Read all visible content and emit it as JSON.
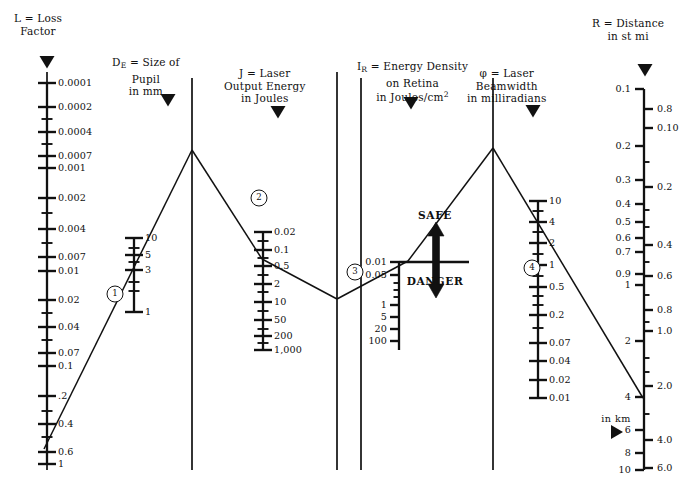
{
  "figure": {
    "kind": "laser-safety-nomogram",
    "width": 698,
    "height": 498,
    "ink": "#111111",
    "bg": "#ffffff"
  },
  "chart_data": {
    "type": "line",
    "xlabel": "",
    "ylabel": "",
    "grid": false,
    "legend": "none",
    "axes": [
      {
        "id": "L",
        "symbol": "L",
        "name": "Loss Factor",
        "header_lines": [
          "L = Loss",
          "Factor"
        ],
        "units": "",
        "label_side": "right",
        "x": 47,
        "y_top": 83,
        "y_bottom": 464,
        "ticks": [
          {
            "label": "0.0001",
            "y": 83,
            "major": true
          },
          {
            "label": "0.0002",
            "y": 107,
            "major": true
          },
          {
            "label": "",
            "y": 119,
            "major": false
          },
          {
            "label": "0.0004",
            "y": 132,
            "major": true
          },
          {
            "label": "",
            "y": 144,
            "major": false
          },
          {
            "label": "0.0007",
            "y": 156,
            "major": true
          },
          {
            "label": "0.001",
            "y": 168,
            "major": true
          },
          {
            "label": "0.002",
            "y": 198,
            "major": true
          },
          {
            "label": "",
            "y": 213,
            "major": false
          },
          {
            "label": "0.004",
            "y": 229,
            "major": true
          },
          {
            "label": "",
            "y": 243,
            "major": false
          },
          {
            "label": "0.007",
            "y": 257,
            "major": true
          },
          {
            "label": "0.01",
            "y": 271,
            "major": true
          },
          {
            "label": "0.02",
            "y": 300,
            "major": true
          },
          {
            "label": "",
            "y": 313,
            "major": false
          },
          {
            "label": "0.04",
            "y": 327,
            "major": true
          },
          {
            "label": "",
            "y": 340,
            "major": false
          },
          {
            "label": "0.07",
            "y": 353,
            "major": true
          },
          {
            "label": "0.1",
            "y": 366,
            "major": true
          },
          {
            "label": ".2",
            "y": 396,
            "major": true
          },
          {
            "label": "",
            "y": 411,
            "major": false
          },
          {
            "label": "0.4",
            "y": 424,
            "major": true
          },
          {
            "label": "",
            "y": 437,
            "major": false
          },
          {
            "label": "0.6",
            "y": 452,
            "major": true
          },
          {
            "label": "1",
            "y": 464,
            "major": true
          }
        ]
      },
      {
        "id": "DE",
        "symbol": "D_E",
        "name": "Size of Pupil",
        "header_lines": [
          "D",
          "E",
          " =  Size of",
          "Pupil",
          "in mm"
        ],
        "units": "mm",
        "label_side": "right",
        "x": 134,
        "y_top": 238,
        "y_bottom": 312,
        "ticks": [
          {
            "label": "10",
            "y": 238,
            "major": true
          },
          {
            "label": "",
            "y": 248,
            "major": false
          },
          {
            "label": "5",
            "y": 255,
            "major": true
          },
          {
            "label": "",
            "y": 262,
            "major": false
          },
          {
            "label": "3",
            "y": 270,
            "major": true
          },
          {
            "label": "",
            "y": 282,
            "major": false
          },
          {
            "label": "",
            "y": 291,
            "major": false
          },
          {
            "label": "1",
            "y": 312,
            "major": true
          }
        ]
      },
      {
        "id": "J",
        "symbol": "J",
        "name": "Laser Output Energy",
        "header_lines": [
          "J = Laser",
          "Output Energy",
          "in Joules"
        ],
        "units": "Joules",
        "label_side": "right",
        "x": 263,
        "y_top": 232,
        "y_bottom": 350,
        "ticks": [
          {
            "label": "0.02",
            "y": 232,
            "major": true
          },
          {
            "label": "",
            "y": 241,
            "major": false
          },
          {
            "label": "0.1",
            "y": 250,
            "major": true
          },
          {
            "label": "",
            "y": 258,
            "major": false
          },
          {
            "label": "0.5",
            "y": 266,
            "major": true
          },
          {
            "label": "",
            "y": 275,
            "major": false
          },
          {
            "label": "2",
            "y": 284,
            "major": true
          },
          {
            "label": "",
            "y": 292,
            "major": false
          },
          {
            "label": "10",
            "y": 302,
            "major": true
          },
          {
            "label": "",
            "y": 311,
            "major": false
          },
          {
            "label": "50",
            "y": 320,
            "major": true
          },
          {
            "label": "",
            "y": 329,
            "major": false
          },
          {
            "label": "200",
            "y": 336,
            "major": true
          },
          {
            "label": "",
            "y": 343,
            "major": false
          },
          {
            "label": "1,000",
            "y": 350,
            "major": true
          }
        ]
      },
      {
        "id": "IR",
        "symbol": "I_R",
        "name": "Energy Density on Retina",
        "header_lines": [
          "I",
          "R",
          " = Energy Density",
          "on Retina",
          "in Joules/cm",
          "2"
        ],
        "units": "Joules/cm2",
        "label_side": "left",
        "x": 399,
        "y_top": 262,
        "y_bottom": 350,
        "ticks": [
          {
            "label": "0.01",
            "y": 262,
            "major": true
          },
          {
            "label": "0.05",
            "y": 275,
            "major": true
          },
          {
            "label": "",
            "y": 283,
            "major": false
          },
          {
            "label": "",
            "y": 290,
            "major": false
          },
          {
            "label": "",
            "y": 297,
            "major": false
          },
          {
            "label": "1",
            "y": 305,
            "major": true
          },
          {
            "label": "5",
            "y": 317,
            "major": true
          },
          {
            "label": "20",
            "y": 329,
            "major": true
          },
          {
            "label": "100",
            "y": 341,
            "major": true
          }
        ]
      },
      {
        "id": "PHI",
        "symbol": "φ",
        "name": "Laser Beamwidth",
        "header_lines": [
          "φ = Laser",
          "Beamwidth",
          "in milliradians"
        ],
        "units": "milliradians",
        "label_side": "right",
        "x": 538,
        "y_top": 201,
        "y_bottom": 398,
        "ticks": [
          {
            "label": "10",
            "y": 201,
            "major": true
          },
          {
            "label": "",
            "y": 211,
            "major": false
          },
          {
            "label": "4",
            "y": 222,
            "major": true
          },
          {
            "label": "",
            "y": 232,
            "major": false
          },
          {
            "label": "2",
            "y": 243,
            "major": true
          },
          {
            "label": "",
            "y": 254,
            "major": false
          },
          {
            "label": "1",
            "y": 265,
            "major": true
          },
          {
            "label": "",
            "y": 276,
            "major": false
          },
          {
            "label": "0.5",
            "y": 287,
            "major": true
          },
          {
            "label": "",
            "y": 296,
            "major": false
          },
          {
            "label": "",
            "y": 305,
            "major": false
          },
          {
            "label": "0.2",
            "y": 315,
            "major": true
          },
          {
            "label": "",
            "y": 328,
            "major": false
          },
          {
            "label": "0.07",
            "y": 343,
            "major": true
          },
          {
            "label": "0.04",
            "y": 361,
            "major": true
          },
          {
            "label": "0.02",
            "y": 380,
            "major": true
          },
          {
            "label": "0.01",
            "y": 398,
            "major": true
          }
        ]
      },
      {
        "id": "R",
        "symbol": "R",
        "name": "Distance",
        "header_lines": [
          "R = Distance",
          "in st mi"
        ],
        "units_left": "st mi",
        "units_right": "km",
        "label_side": "both",
        "x": 644,
        "y_top": 89,
        "y_bottom": 470,
        "ticks_left": [
          {
            "label": "0.1",
            "y": 89,
            "major": true
          },
          {
            "label": "0.2",
            "y": 146,
            "major": true
          },
          {
            "label": "0.3",
            "y": 180,
            "major": true
          },
          {
            "label": "0.4",
            "y": 204,
            "major": true
          },
          {
            "label": "0.5",
            "y": 222,
            "major": true
          },
          {
            "label": "0.6",
            "y": 238,
            "major": true
          },
          {
            "label": "0.7",
            "y": 252,
            "major": true
          },
          {
            "label": "0.9",
            "y": 274,
            "major": true
          },
          {
            "label": "1",
            "y": 285,
            "major": true
          },
          {
            "label": "2",
            "y": 341,
            "major": true
          },
          {
            "label": "4",
            "y": 397,
            "major": true
          },
          {
            "label": "6",
            "y": 430,
            "major": true
          },
          {
            "label": "8",
            "y": 453,
            "major": true
          },
          {
            "label": "10",
            "y": 470,
            "major": true
          }
        ],
        "ticks_right": [
          {
            "label": "0.8",
            "y": 109,
            "major": true
          },
          {
            "label": "0.10",
            "y": 128,
            "major": true
          },
          {
            "label": "",
            "y": 162,
            "major": false
          },
          {
            "label": "0.2",
            "y": 187,
            "major": true
          },
          {
            "label": "",
            "y": 210,
            "major": false
          },
          {
            "label": "",
            "y": 227,
            "major": false
          },
          {
            "label": "0.4",
            "y": 245,
            "major": true
          },
          {
            "label": "",
            "y": 262,
            "major": false
          },
          {
            "label": "0.6",
            "y": 276,
            "major": true
          },
          {
            "label": "",
            "y": 295,
            "major": false
          },
          {
            "label": "0.8",
            "y": 310,
            "major": true
          },
          {
            "label": "",
            "y": 322,
            "major": false
          },
          {
            "label": "1.0",
            "y": 331,
            "major": true
          },
          {
            "label": "",
            "y": 358,
            "major": false
          },
          {
            "label": "",
            "y": 372,
            "major": false
          },
          {
            "label": "2.0",
            "y": 386,
            "major": true
          },
          {
            "label": "",
            "y": 414,
            "major": false
          },
          {
            "label": "4.0",
            "y": 440,
            "major": true
          },
          {
            "label": "6.0",
            "y": 468,
            "major": true
          }
        ]
      }
    ],
    "rails": [
      {
        "name": "rail-L",
        "x": 47,
        "y1": 72,
        "y2": 470
      },
      {
        "name": "rail-DE",
        "x": 192,
        "y1": 78,
        "y2": 470
      },
      {
        "name": "rail-J",
        "x": 337,
        "y1": 72,
        "y2": 470
      },
      {
        "name": "rail-IR",
        "x": 361,
        "y1": 78,
        "y2": 470
      },
      {
        "name": "rail-PHI",
        "x": 493,
        "y1": 78,
        "y2": 470
      }
    ],
    "construction_lines": [
      {
        "name": "line-1",
        "x1": 44,
        "y1": 449,
        "x2": 192,
        "y2": 150
      },
      {
        "name": "line-2",
        "x1": 192,
        "y1": 150,
        "x2": 262,
        "y2": 259
      },
      {
        "name": "line-3",
        "x1": 262,
        "y1": 259,
        "x2": 337,
        "y2": 299
      },
      {
        "name": "line-4",
        "x1": 337,
        "y1": 299,
        "x2": 408,
        "y2": 261
      },
      {
        "name": "line-5",
        "x1": 408,
        "y1": 261,
        "x2": 493,
        "y2": 148
      },
      {
        "name": "line-6",
        "x1": 493,
        "y1": 148,
        "x2": 643,
        "y2": 398
      }
    ],
    "markers": [
      {
        "label": "1",
        "x": 115,
        "y": 294
      },
      {
        "label": "2",
        "x": 259,
        "y": 198
      },
      {
        "label": "3",
        "x": 355,
        "y": 272
      },
      {
        "label": "4",
        "x": 532,
        "y": 268
      }
    ],
    "callouts": {
      "safe": "SAFE",
      "danger": "DANGER",
      "km_note": "in km",
      "threshold_y": 262
    },
    "pointers": [
      {
        "name": "pointer-L",
        "x": 47,
        "y": 62,
        "dir": "down"
      },
      {
        "name": "pointer-DE",
        "x": 168,
        "y": 100,
        "dir": "down"
      },
      {
        "name": "pointer-J",
        "x": 278,
        "y": 112,
        "dir": "down"
      },
      {
        "name": "pointer-IR",
        "x": 411,
        "y": 103,
        "dir": "down"
      },
      {
        "name": "pointer-PHI",
        "x": 533,
        "y": 111,
        "dir": "down"
      },
      {
        "name": "pointer-R",
        "x": 645,
        "y": 70,
        "dir": "down"
      },
      {
        "name": "pointer-km",
        "x": 616,
        "y": 432,
        "dir": "right"
      }
    ]
  },
  "headers": {
    "L": {
      "line1": "L = Loss",
      "line2": "Factor",
      "x": 14,
      "y": 12
    },
    "DE": {
      "sym": "D",
      "sub": "E",
      "rest": " =  Size of",
      "line2": "Pupil",
      "line3": "in mm",
      "x": 112,
      "y": 56
    },
    "J": {
      "line1": "J = Laser",
      "line2": "Output Energy",
      "line3": "in Joules",
      "x": 224,
      "y": 67
    },
    "IR": {
      "sym": "I",
      "sub": "R",
      "rest": " = Energy Density",
      "line2": "on Retina",
      "line3a": "in Joules/cm",
      "line3sup": "2",
      "x": 357,
      "y": 60
    },
    "PHI": {
      "line1": "φ = Laser",
      "line2": "Beamwidth",
      "line3": "in milliradians",
      "x": 467,
      "y": 67
    },
    "R": {
      "line1": "R = Distance",
      "line2": "in st mi",
      "x": 592,
      "y": 17
    }
  }
}
